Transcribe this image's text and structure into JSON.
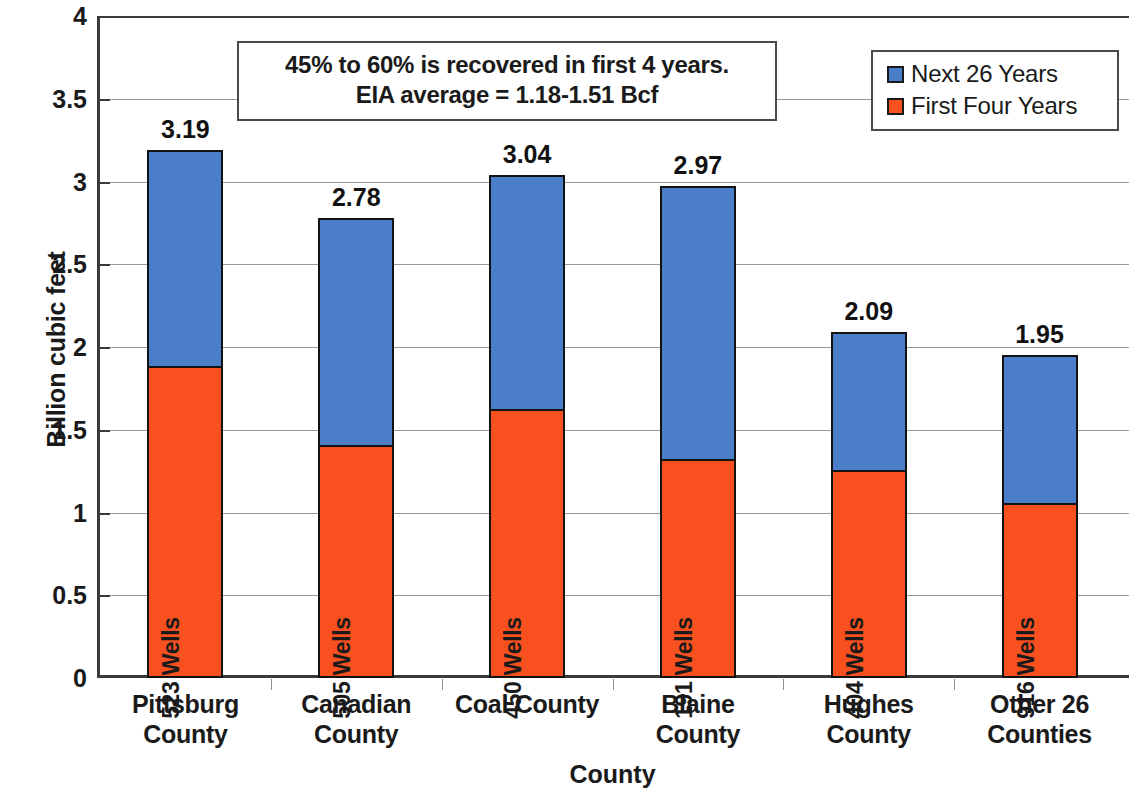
{
  "chart_data": {
    "type": "bar",
    "subtype": "stacked-column",
    "title": "",
    "xlabel": "County",
    "ylabel": "Billion cubic feet",
    "ylim": [
      0,
      4
    ],
    "ytick_step": 0.5,
    "yticks": [
      "0",
      "0.5",
      "1",
      "1.5",
      "2",
      "2.5",
      "3",
      "3.5",
      "4"
    ],
    "grid": true,
    "grid_axis": "y",
    "legend_position": "top-right",
    "categories": [
      "Pittsburg County",
      "Canadian County",
      "Coal County",
      "Blaine County",
      "Hughes County",
      "Other 26 Counties"
    ],
    "category_lines": [
      [
        "Pittsburg",
        "County"
      ],
      [
        "Canadian",
        "County"
      ],
      [
        "Coal County",
        ""
      ],
      [
        "Blaine",
        "County"
      ],
      [
        "Hughes",
        "County"
      ],
      [
        "Other 26",
        "Counties"
      ]
    ],
    "series": [
      {
        "name": "First Four Years",
        "color": "#f9501f",
        "values": [
          1.88,
          1.4,
          1.62,
          1.32,
          1.25,
          1.05
        ]
      },
      {
        "name": "Next 26 Years",
        "color": "#4a7ec8",
        "values": [
          1.31,
          1.38,
          1.42,
          1.65,
          0.84,
          0.9
        ]
      }
    ],
    "totals": [
      "3.19",
      "2.78",
      "3.04",
      "2.97",
      "2.09",
      "1.95"
    ],
    "total_values": [
      3.19,
      2.78,
      3.04,
      2.97,
      2.09,
      1.95
    ],
    "point_labels": [
      "523 Wells",
      "505 Wells",
      "450 Wells",
      "191 Wells",
      "404 Wells",
      "916 Wells"
    ],
    "well_counts": [
      523,
      505,
      450,
      191,
      404,
      916
    ],
    "annotations": [
      "45% to 60% is recovered in first 4 years.",
      "EIA average = 1.18-1.51 Bcf"
    ]
  },
  "legend": {
    "items": [
      {
        "label": "Next 26 Years",
        "color": "#4a7ec8"
      },
      {
        "label": "First Four Years",
        "color": "#f9501f"
      }
    ]
  },
  "annotation": {
    "line1": "45% to 60% is recovered in first 4 years.",
    "line2": "EIA average = 1.18-1.51 Bcf"
  },
  "axes": {
    "y_title": "Billion cubic feet",
    "x_title": "County"
  },
  "colors": {
    "series_next": "#4a7ec8",
    "series_first": "#f9501f",
    "axis": "#3a3a3a",
    "grid": "#9a9a9a",
    "text": "#1a1a1a",
    "background": "#ffffff"
  }
}
